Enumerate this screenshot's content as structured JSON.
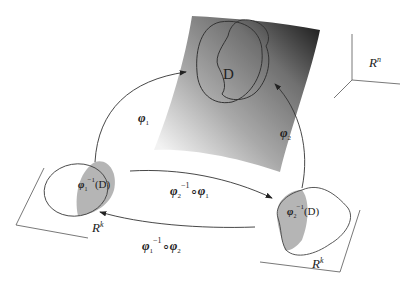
{
  "diagram": {
    "manifold": {
      "label_region": "D",
      "shading_light": "#e4e4e4",
      "shading_dark": "#1e1e1e"
    },
    "ambient_space": {
      "base": "R",
      "exp": "n"
    },
    "chart_left": {
      "base": "R",
      "exp": "k",
      "preimage_phi": "φ",
      "preimage_sub": "1",
      "preimage_sup": "−1",
      "preimage_arg": "(D)"
    },
    "chart_right": {
      "base": "R",
      "exp": "k",
      "preimage_phi": "φ",
      "preimage_sub": "2",
      "preimage_sup": "−1",
      "preimage_arg": "(D)"
    },
    "maps": {
      "phi1": {
        "sym": "φ",
        "sub": "1"
      },
      "phi2": {
        "sym": "φ",
        "sub": "2"
      },
      "transition_12": {
        "a": "φ",
        "a_sub": "2",
        "a_sup": "−1",
        "op": "∘",
        "b": "φ",
        "b_sub": "1"
      },
      "transition_21": {
        "a": "φ",
        "a_sub": "1",
        "a_sup": "−1",
        "op": "∘",
        "b": "φ",
        "b_sub": "2"
      }
    },
    "colors": {
      "line": "#333333",
      "shade": "#b5b5b5"
    }
  }
}
